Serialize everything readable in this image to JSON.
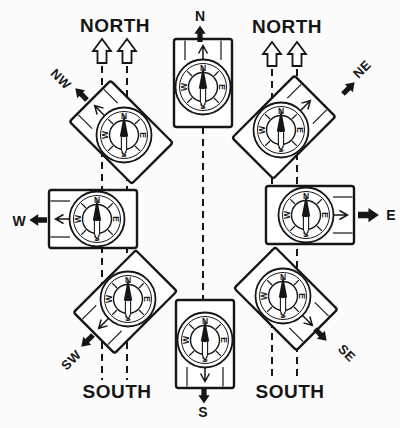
{
  "labels": {
    "north_left": "NORTH",
    "north_right": "NORTH",
    "south_left": "SOUTH",
    "south_right": "SOUTH"
  },
  "dial_letters": {
    "north": "N",
    "east": "E",
    "south": "S",
    "west": "W"
  },
  "directions": [
    {
      "id": "north",
      "label": "N",
      "label_x": 200,
      "label_y": 16,
      "label_rot": 0,
      "arrow_x": 200,
      "arrow_y": 42,
      "arrow_angle": -90,
      "arrow_scale": 0.75
    },
    {
      "id": "northeast",
      "label": "NE",
      "label_x": 362,
      "label_y": 69,
      "label_rot": -45,
      "arrow_x": 343,
      "arrow_y": 94,
      "arrow_angle": -45,
      "arrow_scale": 0.75
    },
    {
      "id": "east",
      "label": "E",
      "label_x": 391,
      "label_y": 215,
      "label_rot": 0,
      "arrow_x": 358,
      "arrow_y": 215,
      "arrow_angle": 0,
      "arrow_scale": 0.95
    },
    {
      "id": "southeast",
      "label": "SE",
      "label_x": 347,
      "label_y": 353,
      "label_rot": 45,
      "arrow_x": 315,
      "arrow_y": 329,
      "arrow_angle": 45,
      "arrow_scale": 0.75
    },
    {
      "id": "south",
      "label": "S",
      "label_x": 203,
      "label_y": 412,
      "label_rot": 0,
      "arrow_x": 204,
      "arrow_y": 387,
      "arrow_angle": 90,
      "arrow_scale": 0.75
    },
    {
      "id": "southwest",
      "label": "SW",
      "label_x": 71,
      "label_y": 360,
      "label_rot": -45,
      "arrow_x": 93,
      "arrow_y": 335,
      "arrow_angle": 135,
      "arrow_scale": 0.75
    },
    {
      "id": "west",
      "label": "W",
      "label_x": 19,
      "label_y": 221,
      "label_rot": 0,
      "arrow_x": 47,
      "arrow_y": 220,
      "arrow_angle": 180,
      "arrow_scale": 0.8
    },
    {
      "id": "northwest",
      "label": "NW",
      "label_x": 61,
      "label_y": 79,
      "label_rot": 45,
      "arrow_x": 87,
      "arrow_y": 100,
      "arrow_angle": -135,
      "arrow_scale": 0.75
    }
  ],
  "compasses": [
    {
      "direction": "north",
      "cx": 203,
      "cy": 87,
      "rotation": 0
    },
    {
      "direction": "northeast",
      "cx": 281,
      "cy": 130,
      "rotation": 45
    },
    {
      "direction": "east",
      "cx": 306,
      "cy": 215,
      "rotation": 90
    },
    {
      "direction": "southeast",
      "cx": 283,
      "cy": 296,
      "rotation": 135
    },
    {
      "direction": "south",
      "cx": 205,
      "cy": 340,
      "rotation": 180
    },
    {
      "direction": "southwest",
      "cx": 128,
      "cy": 299,
      "rotation": 225
    },
    {
      "direction": "west",
      "cx": 97,
      "cy": 219,
      "rotation": 270
    },
    {
      "direction": "northwest",
      "cx": 124,
      "cy": 135,
      "rotation": 315
    }
  ],
  "reference_columns": {
    "left": {
      "xs": [
        102,
        127
      ],
      "arrow_base_y": 63,
      "dash_y1": 66,
      "dash_y2": 380
    },
    "right": {
      "xs": [
        272,
        297
      ],
      "arrow_base_y": 66,
      "dash_y1": 69,
      "dash_y2": 380
    },
    "center": {
      "x": 203,
      "dash_y1": 55,
      "dash_y2": 386
    }
  },
  "colors": {
    "ink": "#161616",
    "paper": "#fcfcfc"
  }
}
